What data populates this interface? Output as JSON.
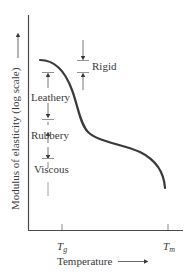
{
  "diagram": {
    "title": "",
    "ylabel": "Modulus of elasticity (log scale)",
    "xlabel": "Temperature",
    "x_ticks": [
      {
        "label": "T",
        "sub": "g",
        "x": 62
      },
      {
        "label": "T",
        "sub": "m",
        "x": 168
      }
    ],
    "regions": [
      {
        "label": "Rigid"
      },
      {
        "label": "Leathery"
      },
      {
        "label": "Rubbery"
      },
      {
        "label": "Viscous"
      }
    ],
    "colors": {
      "curve": "#3a3a3a",
      "axis": "#4a4a4a",
      "annotation": "#6a6a6a",
      "background": "#ffffff"
    }
  }
}
